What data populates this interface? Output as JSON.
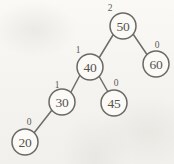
{
  "figure": {
    "type": "avl-binary-search-tree-diagram",
    "width": 174,
    "height": 164,
    "background_color": "#f7f6f3",
    "stroke_color": "#6b6964",
    "text_color": "#55534f"
  },
  "nodes": [
    {
      "id": "n50",
      "key": "50",
      "balance": "2",
      "cx": 123,
      "cy": 26,
      "r": 13,
      "balance_x": 110,
      "balance_y": 8,
      "role": "root"
    },
    {
      "id": "n40",
      "key": "40",
      "balance": "1",
      "cx": 90,
      "cy": 67,
      "r": 13,
      "balance_x": 78,
      "balance_y": 50,
      "role": "left-child-of-50"
    },
    {
      "id": "n60",
      "key": "60",
      "balance": "0",
      "cx": 156,
      "cy": 64,
      "r": 13,
      "balance_x": 157,
      "balance_y": 45,
      "role": "right-child-of-50"
    },
    {
      "id": "n30",
      "key": "30",
      "balance": "1",
      "cx": 62,
      "cy": 102,
      "r": 13,
      "balance_x": 57,
      "balance_y": 85,
      "role": "left-child-of-40"
    },
    {
      "id": "n45",
      "key": "45",
      "balance": "0",
      "cx": 114,
      "cy": 103,
      "r": 13,
      "balance_x": 116,
      "balance_y": 83,
      "role": "right-child-of-40"
    },
    {
      "id": "n20",
      "key": "20",
      "balance": "0",
      "cx": 25,
      "cy": 142,
      "r": 13,
      "balance_x": 29,
      "balance_y": 122,
      "role": "left-child-of-30"
    }
  ],
  "edges": [
    {
      "id": "e50-40",
      "from": "n50",
      "to": "n40",
      "x1": 113,
      "y1": 35,
      "x2": 99,
      "y2": 58,
      "label": "edge-50-to-40"
    },
    {
      "id": "e50-60",
      "from": "n50",
      "to": "n60",
      "x1": 133,
      "y1": 34,
      "x2": 148,
      "y2": 56,
      "label": "edge-50-to-60"
    },
    {
      "id": "e40-30",
      "from": "n40",
      "to": "n30",
      "x1": 80,
      "y1": 75,
      "x2": 71,
      "y2": 92,
      "label": "edge-40-to-30"
    },
    {
      "id": "e40-45",
      "from": "n40",
      "to": "n45",
      "x1": 99,
      "y1": 76,
      "x2": 108,
      "y2": 92,
      "label": "edge-40-to-45"
    },
    {
      "id": "e30-20",
      "from": "n30",
      "to": "n20",
      "x1": 52,
      "y1": 110,
      "x2": 34,
      "y2": 133,
      "label": "edge-30-to-20"
    }
  ]
}
